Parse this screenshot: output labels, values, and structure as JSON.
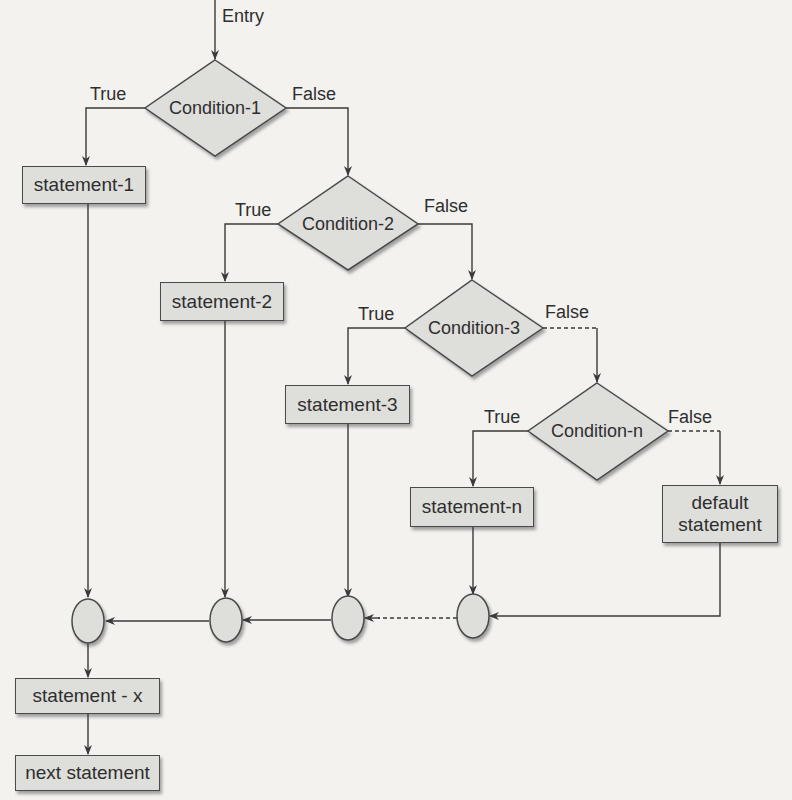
{
  "entry": {
    "label": "Entry"
  },
  "conditions": [
    {
      "label": "Condition-1",
      "true_label": "True",
      "false_label": "False"
    },
    {
      "label": "Condition-2",
      "true_label": "True",
      "false_label": "False"
    },
    {
      "label": "Condition-3",
      "true_label": "True",
      "false_label": "False"
    },
    {
      "label": "Condition-n",
      "true_label": "True",
      "false_label": "False"
    }
  ],
  "statements": [
    {
      "label": "statement-1"
    },
    {
      "label": "statement-2"
    },
    {
      "label": "statement-3"
    },
    {
      "label": "statement-n"
    },
    {
      "label": "default statement"
    }
  ],
  "exit": {
    "statement_x": "statement - x",
    "next_statement": "next statement"
  },
  "colors": {
    "background": "#f3f2ef",
    "shape_fill": "#dededb",
    "stroke": "#4a4a4a",
    "text": "#2e2e2e"
  }
}
